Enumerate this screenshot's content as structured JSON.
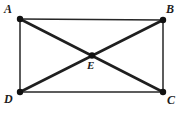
{
  "figure": {
    "type": "geometry-diagram",
    "canvas": {
      "width": 182,
      "height": 113,
      "background": "#ffffff"
    },
    "style": {
      "stroke_color": "#262626",
      "edge_stroke_width": 1.5,
      "diagonal_stroke_width": 2.6,
      "vertex_dot_color": "#111111",
      "vertex_dot_radius": 3.1,
      "label_color": "#1c1c1c"
    },
    "points": [
      {
        "id": "A",
        "label": "A",
        "x": 20,
        "y": 19,
        "role": "rectangle-vertex",
        "label_position": "top-left"
      },
      {
        "id": "B",
        "label": "B",
        "x": 163,
        "y": 20,
        "role": "rectangle-vertex",
        "label_position": "top-right"
      },
      {
        "id": "C",
        "label": "C",
        "x": 163,
        "y": 92,
        "role": "rectangle-vertex",
        "label_position": "bottom-right"
      },
      {
        "id": "D",
        "label": "D",
        "x": 20,
        "y": 92,
        "role": "rectangle-vertex",
        "label_position": "bottom-left"
      },
      {
        "id": "E",
        "label": "E",
        "x": 92,
        "y": 55.5,
        "role": "diagonal-intersection",
        "label_position": "below-right"
      }
    ],
    "segments": [
      {
        "id": "AB",
        "from": "A",
        "to": "B",
        "kind": "edge"
      },
      {
        "id": "BC",
        "from": "B",
        "to": "C",
        "kind": "edge"
      },
      {
        "id": "CD",
        "from": "C",
        "to": "D",
        "kind": "edge"
      },
      {
        "id": "DA",
        "from": "D",
        "to": "A",
        "kind": "edge"
      },
      {
        "id": "AC",
        "from": "A",
        "to": "C",
        "kind": "diagonal"
      },
      {
        "id": "BD",
        "from": "B",
        "to": "D",
        "kind": "diagonal"
      }
    ],
    "labels": {
      "a": "A",
      "b": "B",
      "c": "C",
      "d": "D",
      "e": "E"
    }
  }
}
